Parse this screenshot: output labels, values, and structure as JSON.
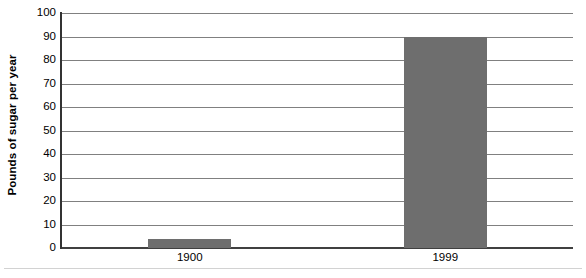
{
  "chart_data": {
    "type": "bar",
    "title": "",
    "subtitle": "",
    "xlabel": "",
    "ylabel": "Pounds of sugar per year",
    "categories": [
      "1900",
      "1999"
    ],
    "values": [
      4,
      90
    ],
    "ylim": [
      0,
      100
    ],
    "yticks": [
      0,
      10,
      20,
      30,
      40,
      50,
      60,
      70,
      80,
      90,
      100
    ],
    "ytick_labels": [
      "0",
      "10",
      "20",
      "30",
      "40",
      "50",
      "60",
      "70",
      "80",
      "90",
      "100"
    ],
    "grid": true,
    "legend": null,
    "legend_position": "none",
    "bar_color": "#6e6e6e",
    "gridline_color": "#808080",
    "axis_color": "#333333",
    "background_color": "#ffffff",
    "annotations": []
  },
  "axes": {
    "y_title": "Pounds of sugar per year"
  }
}
